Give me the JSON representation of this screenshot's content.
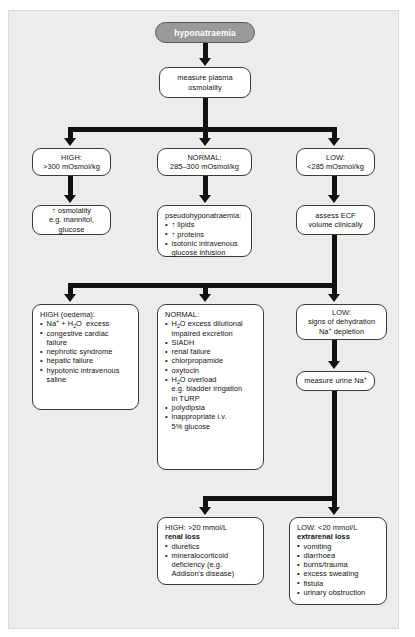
{
  "diagram": {
    "title": "hyponatraemia",
    "nodes": {
      "root": "hyponatraemia",
      "measure_osmolality": [
        "measure plasma",
        "osmolality"
      ],
      "high_osm": [
        "HIGH:",
        ">300 mOsmol/kg"
      ],
      "normal_osm": [
        "NORMAL:",
        "285–300 mOsmol/kg"
      ],
      "low_osm": [
        "LOW:",
        "<285 mOsmol/kg"
      ],
      "osmolality_raised": [
        "↑ osmolality",
        "e.g. mannitol, glucose"
      ],
      "pseudo_header": "pseudohyponatraemia:",
      "pseudo_items": [
        "↑ lipids",
        "↑ proteins",
        "isotonic intravenous",
        "glucose infusion"
      ],
      "assess_ecf": [
        "assess ECF",
        "volume clinically"
      ],
      "high_oedema_header": "HIGH (oedema):",
      "high_oedema_items": [
        "Na+ + H2O  excess",
        "congestive cardiac",
        "failure",
        "nephrotic syndrome",
        "hepatic failure",
        "hypotonic intravenous",
        "saline"
      ],
      "normal_header": "NORMAL:",
      "normal_items": [
        "H2O excess dilutional",
        "impaired excretion",
        "SIADH",
        "renal failure",
        "chlorpropamide",
        "oxytocin",
        "H2O overload",
        "e.g. bladder irrigation",
        "in TURP",
        "polydipsia",
        "inappropriate i.v.",
        "5% glucose"
      ],
      "low_dehydration": [
        "LOW:",
        "signs of dehydration",
        "Na+ depletion"
      ],
      "measure_urine_na": "measure urine Na+",
      "renal_loss_header_1": "HIGH: >20 mmol/L",
      "renal_loss_header_2": "renal loss",
      "renal_loss_items": [
        "diuretics",
        "mineralocorticoid",
        "deficiency (e.g.",
        "Addison's disease)"
      ],
      "extrarenal_header_1": "LOW: <20 mmol/L",
      "extrarenal_header_2": "extrarenal loss",
      "extrarenal_items": [
        "vomiting",
        "diarrhoea",
        "burns/trauma",
        "excess sweating",
        "fistula",
        "urinary obstruction"
      ]
    },
    "colors": {
      "panel_background": "#ececed",
      "page_background": "#ffffff",
      "node_fill": "#ffffff",
      "node_border": "#3a3a3a",
      "title_pill_fill": "#9a9a9c",
      "title_pill_text": "#ffffff",
      "connector": "#111111",
      "text": "#111111"
    }
  }
}
